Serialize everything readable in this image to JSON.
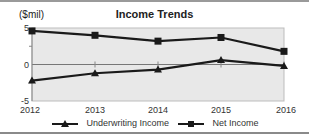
{
  "chart_data": {
    "type": "line",
    "title": "Income Trends",
    "ylabel": "($mil)",
    "xlabel": "",
    "categories": [
      "2012",
      "2013",
      "2014",
      "2015",
      "2016"
    ],
    "series": [
      {
        "name": "Underwriting Income",
        "marker": "triangle",
        "values": [
          -2.2,
          -1.2,
          -0.7,
          0.6,
          -0.2
        ]
      },
      {
        "name": "Net Income",
        "marker": "square",
        "values": [
          4.6,
          4.0,
          3.2,
          3.7,
          1.8
        ]
      }
    ],
    "yticks": [
      "5",
      "0",
      "-5"
    ],
    "ylim": [
      -5,
      5
    ],
    "grid": false,
    "legend_position": "bottom"
  },
  "colors": {
    "plot_bg": "#e8e8e8",
    "line": "#1a1a1a"
  }
}
